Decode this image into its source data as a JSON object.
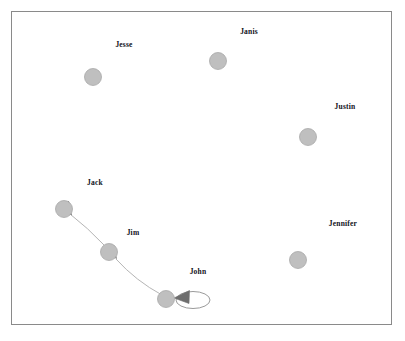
{
  "diagram": {
    "type": "directed-graph",
    "title": "",
    "background_color": "#ffffff",
    "frame": {
      "x": 11,
      "y": 11,
      "width": 381,
      "height": 314,
      "border_color": "#8a8a8a",
      "border_width": 1
    },
    "node_style": {
      "fill_color": "#bfbfbf",
      "stroke_color": "#a6a6a6",
      "radius": 8.5
    },
    "edge_style": {
      "line_color": "#b0b0b0",
      "arrowhead_color": "#6e6e6e",
      "loop_stroke_color": "#8f8f8f"
    },
    "label_color": "#12121a",
    "nodes": [
      {
        "id": "jesse",
        "label": "Jesse",
        "cx": 93,
        "cy": 77,
        "label_x": 124,
        "label_y": 44
      },
      {
        "id": "janis",
        "label": "Janis",
        "cx": 218,
        "cy": 61,
        "label_x": 249,
        "label_y": 31
      },
      {
        "id": "justin",
        "label": "Justin",
        "cx": 308,
        "cy": 137,
        "label_x": 345,
        "label_y": 106
      },
      {
        "id": "jennifer",
        "label": "Jennifer",
        "cx": 298,
        "cy": 260,
        "label_x": 343,
        "label_y": 223
      },
      {
        "id": "jack",
        "label": "Jack",
        "cx": 64,
        "cy": 209,
        "label_x": 95,
        "label_y": 182
      },
      {
        "id": "jim",
        "label": "Jim",
        "cx": 109,
        "cy": 252,
        "label_x": 133,
        "label_y": 232
      },
      {
        "id": "john",
        "label": "John",
        "cx": 166,
        "cy": 299,
        "label_x": 198,
        "label_y": 271
      }
    ],
    "edges": [
      {
        "id": "john-to-jim",
        "from": "john",
        "to": "jim",
        "directed": true,
        "kind": "curve"
      },
      {
        "id": "jim-to-jack",
        "from": "jim",
        "to": "jack",
        "directed": true,
        "kind": "curve"
      },
      {
        "id": "john-to-john",
        "from": "john",
        "to": "john",
        "directed": true,
        "kind": "self-loop"
      }
    ]
  }
}
